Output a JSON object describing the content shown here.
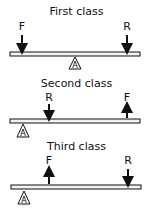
{
  "diagram": {
    "colors": {
      "stroke": "#111111",
      "fill": "#ffffff",
      "beam_fill": "#f2f2f2"
    },
    "legend": {
      "F": "Force (effort)",
      "R": "Resistance (load)",
      "A": "Fulcrum (axis)"
    },
    "panels": [
      {
        "title": "First class",
        "fulcrum_label": "A",
        "fulcrum_position": "middle",
        "forces": [
          {
            "label": "F",
            "direction": "down",
            "position": "left end"
          },
          {
            "label": "R",
            "direction": "down",
            "position": "right end"
          }
        ]
      },
      {
        "title": "Second class",
        "fulcrum_label": "A",
        "fulcrum_position": "left end",
        "forces": [
          {
            "label": "R",
            "direction": "down",
            "position": "middle"
          },
          {
            "label": "F",
            "direction": "up",
            "position": "right end"
          }
        ]
      },
      {
        "title": "Third class",
        "fulcrum_label": "A",
        "fulcrum_position": "left end",
        "forces": [
          {
            "label": "F",
            "direction": "up",
            "position": "middle"
          },
          {
            "label": "R",
            "direction": "down",
            "position": "right end"
          }
        ]
      }
    ]
  }
}
